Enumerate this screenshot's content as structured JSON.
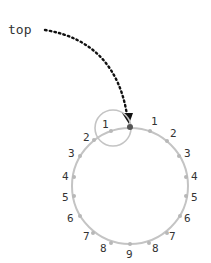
{
  "diagram": {
    "annotation": "top",
    "colors": {
      "circle": "#c4c4c4",
      "dots": "#b8b8b8",
      "top_point": "#555555",
      "arrow": "#111111",
      "text": "#333333"
    },
    "big_circle": {
      "cx": 130,
      "cy": 186,
      "r": 58
    },
    "small_circle": {
      "cx": 113,
      "cy": 128,
      "r": 18
    },
    "small_circle_label": "1",
    "left_labels": [
      "2",
      "3",
      "4",
      "5",
      "6",
      "7",
      "8"
    ],
    "right_labels": [
      "1",
      "2",
      "3",
      "4",
      "5",
      "6",
      "7",
      "8"
    ],
    "bottom_label": "9"
  }
}
